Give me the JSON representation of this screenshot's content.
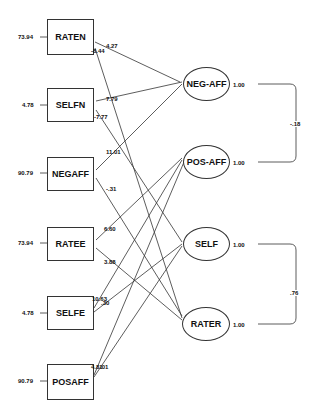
{
  "observed": [
    {
      "name": "RATEN",
      "error": "73.94",
      "loadings": [
        "4.27",
        "-8.44"
      ]
    },
    {
      "name": "SELFN",
      "error": "4.78",
      "loadings": [
        "7.79",
        "-7.77"
      ]
    },
    {
      "name": "NEGAFF",
      "error": "90.79",
      "loadings": [
        "11.01",
        "-.31"
      ]
    },
    {
      "name": "RATEE",
      "error": "73.94",
      "loadings": [
        "6.60",
        "3.88"
      ]
    },
    {
      "name": "SELFE",
      "error": "4.78",
      "loadings": [
        "10.63",
        ".30"
      ]
    },
    {
      "name": "POSAFF",
      "error": "90.79",
      "loadings": [
        "4.81",
        ".01"
      ]
    }
  ],
  "latent": [
    {
      "name": "NEG-AFF",
      "variance": "1.00"
    },
    {
      "name": "POS-AFF",
      "variance": "1.00"
    },
    {
      "name": "SELF",
      "variance": "1.00"
    },
    {
      "name": "RATER",
      "variance": "1.00"
    }
  ],
  "covariances": [
    {
      "between": [
        "NEG-AFF",
        "POS-AFF"
      ],
      "value": "-.18"
    },
    {
      "between": [
        "SELF",
        "RATER"
      ],
      "value": ".76"
    }
  ]
}
